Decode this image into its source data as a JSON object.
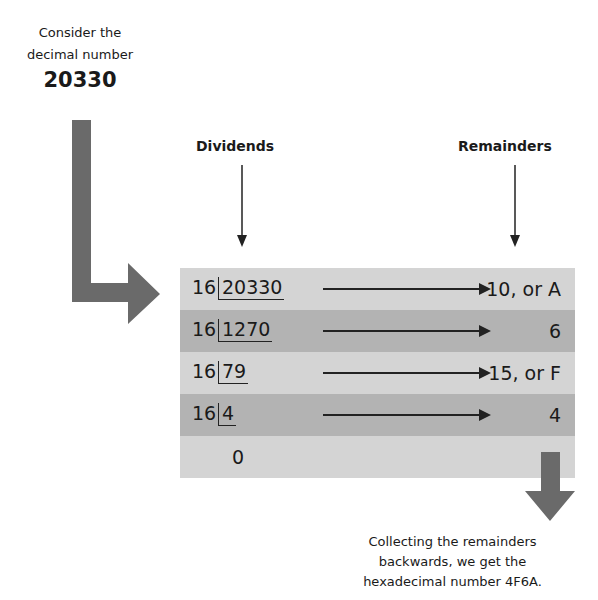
{
  "intro": {
    "line1": "Consider the",
    "line2": "decimal number",
    "number": "20330"
  },
  "columns": {
    "dividends": "Dividends",
    "remainders": "Remainders"
  },
  "divisor": "16",
  "rows": [
    {
      "dividend": "20330",
      "remainder": "10, or A"
    },
    {
      "dividend": "1270",
      "remainder": "6"
    },
    {
      "dividend": "79",
      "remainder": "15, or F"
    },
    {
      "dividend": "4",
      "remainder": "4"
    }
  ],
  "final_quotient": "0",
  "caption": {
    "line1": "Collecting the remainders",
    "line2": "backwards, we get the",
    "line3": "hexadecimal number 4F6A."
  },
  "colors": {
    "row_light": "#d4d4d4",
    "row_dark": "#b3b3b3",
    "big_arrow": "#6a6a6a"
  }
}
